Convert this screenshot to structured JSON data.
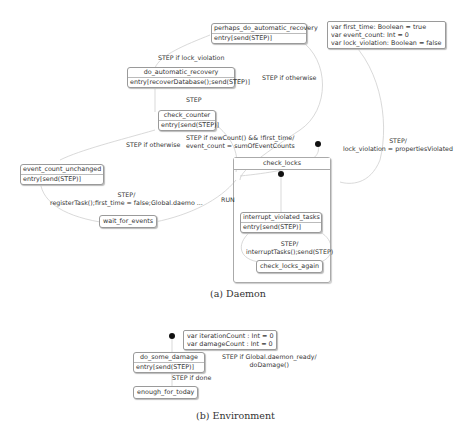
{
  "daemon": {
    "caption": "(a) Daemon",
    "variables": [
      "var first_time: Boolean = true",
      "var event_count: Int = 0",
      "var lock_violation: Boolean = false"
    ],
    "states": {
      "perhaps_do_automatic_recovery": {
        "name": "perhaps_do_automatic_recovery",
        "entry": "entry[send(STEP)]"
      },
      "do_automatic_recovery": {
        "name": "do_automatic_recovery",
        "entry": "entry[recoverDatabase();send(STEP)]"
      },
      "check_counter": {
        "name": "check_counter",
        "entry": "entry[send(STEP)]"
      },
      "event_count_unchanged": {
        "name": "event_count_unchanged",
        "entry": "entry[send(STEP)]"
      },
      "wait_for_events": {
        "name": "wait_for_events"
      },
      "check_locks": {
        "name": "check_locks"
      },
      "interrupt_violated_tasks": {
        "name": "interrupt_violated_tasks",
        "entry": "entry[send(STEP)]"
      },
      "check_locks_again": {
        "name": "check_locks_again"
      }
    },
    "transitions": {
      "step_if_lock_violation": "STEP if lock_violation",
      "step_if_otherwise_top": "STEP if otherwise",
      "step": "STEP",
      "step_if_otherwise_left": "STEP if otherwise",
      "step_if_newcount_line1": "STEP if newCount() && !first_time/",
      "step_if_newcount_line2": "event_count = sumOfEventCounts",
      "register_line1": "STEP/",
      "register_line2": "registerTask();first_time = false;Global.daemo ...",
      "run": "RUN",
      "lock_violation_line1": "STEP/",
      "lock_violation_line2": "lock_violation = propertiesViolated",
      "interrupt_line1": "STEP/",
      "interrupt_line2": "interruptTasks();send(STEP)"
    }
  },
  "environment": {
    "caption": "(b) Environment",
    "variables": [
      "var iterationCount : Int = 0",
      "var damageCount : Int = 0"
    ],
    "states": {
      "do_some_damage": {
        "name": "do_some_damage",
        "entry": "entry[send(STEP)]"
      },
      "enough_for_today": {
        "name": "enough_for_today"
      }
    },
    "transitions": {
      "global_ready_line1": "STEP if Global.daemon_ready/",
      "global_ready_line2": "doDamage()",
      "step_if_done": "STEP if done"
    }
  },
  "colors": {
    "line": "#c8c8c8",
    "border": "#9a9a9a",
    "text": "#333333",
    "dot": "#111111"
  }
}
